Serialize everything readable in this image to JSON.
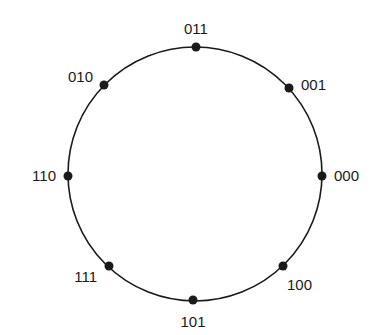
{
  "diagram": {
    "type": "circular-ring",
    "colors": {
      "line": "#1a1a1a",
      "dot": "#1a1a1a",
      "text": "#1a1a1a",
      "background": "#ffffff"
    },
    "ring": {
      "cx": 195,
      "cy": 174,
      "r": 127
    },
    "nodes": [
      {
        "label": "000",
        "dot": {
          "x": 322,
          "y": 176
        },
        "text": {
          "x": 334,
          "y": 181,
          "anchor": "start"
        }
      },
      {
        "label": "001",
        "dot": {
          "x": 289,
          "y": 88
        },
        "text": {
          "x": 301,
          "y": 90,
          "anchor": "start"
        }
      },
      {
        "label": "011",
        "dot": {
          "x": 196,
          "y": 47
        },
        "text": {
          "x": 196,
          "y": 34,
          "anchor": "middle"
        }
      },
      {
        "label": "010",
        "dot": {
          "x": 104,
          "y": 85
        },
        "text": {
          "x": 93,
          "y": 82,
          "anchor": "end"
        }
      },
      {
        "label": "110",
        "dot": {
          "x": 68,
          "y": 176
        },
        "text": {
          "x": 56,
          "y": 181,
          "anchor": "end"
        }
      },
      {
        "label": "111",
        "dot": {
          "x": 109,
          "y": 266
        },
        "text": {
          "x": 97,
          "y": 282,
          "anchor": "end"
        }
      },
      {
        "label": "101",
        "dot": {
          "x": 193,
          "y": 300
        },
        "text": {
          "x": 193,
          "y": 327,
          "anchor": "middle"
        }
      },
      {
        "label": "100",
        "dot": {
          "x": 283,
          "y": 266
        },
        "text": {
          "x": 287,
          "y": 290,
          "anchor": "start"
        }
      }
    ]
  }
}
